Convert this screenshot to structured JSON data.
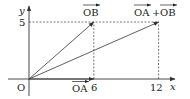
{
  "diagram": {
    "type": "vector-addition-coordinate-plane",
    "axes": {
      "x_label": "x",
      "y_label": "y",
      "origin_label": "O",
      "x_ticks": [
        6,
        12
      ],
      "y_ticks": [
        5
      ],
      "x_tick_labels": [
        "6",
        "12"
      ],
      "y_tick_labels": [
        "5"
      ]
    },
    "vectors": [
      {
        "name": "OA",
        "label": "OA",
        "from": [
          0,
          0
        ],
        "to": [
          6,
          0
        ]
      },
      {
        "name": "OB",
        "label": "OB",
        "from": [
          0,
          0
        ],
        "to": [
          6,
          5
        ]
      },
      {
        "name": "OA+OB",
        "label_parts": [
          "OA",
          "+",
          "OB"
        ],
        "from": [
          0,
          0
        ],
        "to": [
          12,
          5
        ]
      }
    ],
    "guide_lines": [
      {
        "from": [
          0,
          5
        ],
        "to": [
          12,
          5
        ]
      },
      {
        "from": [
          6,
          0
        ],
        "to": [
          6,
          5
        ]
      },
      {
        "from": [
          12,
          0
        ],
        "to": [
          12,
          5
        ]
      }
    ]
  }
}
